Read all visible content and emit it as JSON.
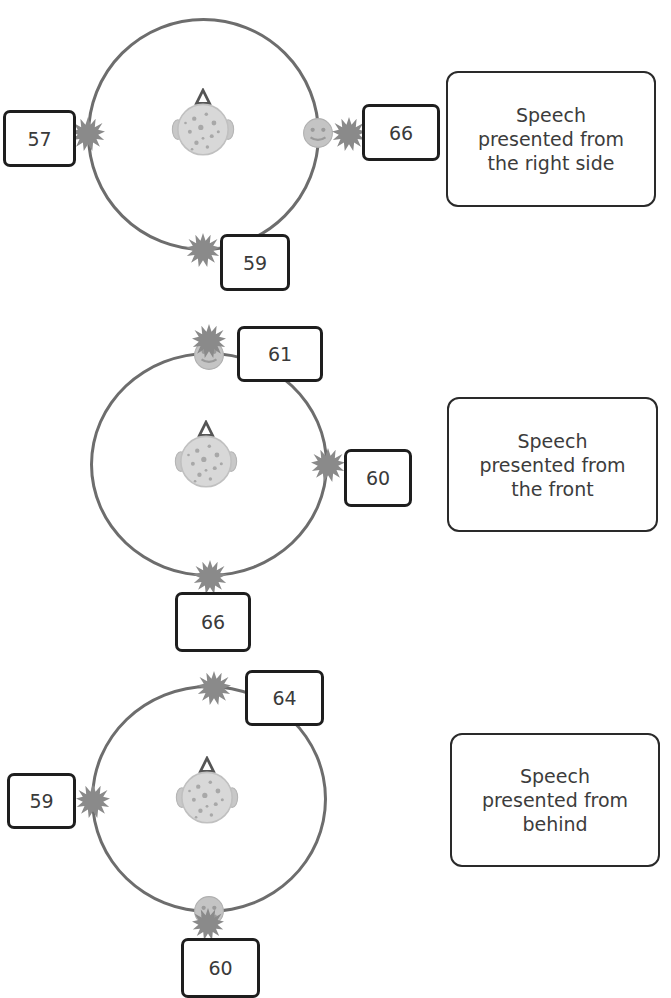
{
  "figure": {
    "panels": [
      {
        "id": "right",
        "caption_lines": [
          "Speech",
          "presented from",
          "the right side"
        ],
        "speech_source": "right",
        "noise_values": {
          "left": "57",
          "right": "66",
          "back": "59"
        }
      },
      {
        "id": "front",
        "caption_lines": [
          "Speech",
          "presented from",
          "the front"
        ],
        "speech_source": "front",
        "noise_values": {
          "front": "61",
          "right": "60",
          "back": "66"
        }
      },
      {
        "id": "behind",
        "caption_lines": [
          "Speech",
          "presented from",
          "behind"
        ],
        "speech_source": "back",
        "noise_values": {
          "front": "64",
          "left": "59",
          "back": "60"
        }
      }
    ],
    "icons": {
      "listener": "listener-head-icon",
      "speech": "speaker-face-icon",
      "noise": "noise-burst-icon"
    },
    "colors": {
      "ring": "#6d6d6d",
      "box_border": "#1e1e1e",
      "noise": "#8a8a8a",
      "face": "#c8c8c8",
      "nose_triangle": "#555555"
    }
  }
}
